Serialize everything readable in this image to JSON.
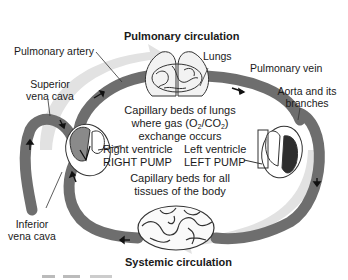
{
  "diagram": {
    "titles": {
      "top": "Pulmonary circulation",
      "bottom": "Systemic circulation"
    },
    "labels": {
      "pulmonary_artery": "Pulmonary artery",
      "lungs": "Lungs",
      "pulmonary_vein": "Pulmonary vein",
      "superior_vena_cava_1": "Superior",
      "superior_vena_cava_2": "vena cava",
      "aorta_1": "Aorta and its",
      "aorta_2": "branches",
      "inferior_vena_cava_1": "Inferior",
      "inferior_vena_cava_2": "vena cava"
    },
    "center": {
      "lung_beds_line1": "Capillary beds of lungs",
      "lung_beds_line2_pre": "where gas (O",
      "lung_beds_sub1": "2",
      "lung_beds_mid": "/CO",
      "lung_beds_sub2": "2",
      "lung_beds_post": ")",
      "lung_beds_line3": "exchange occurs",
      "right_ventricle": "Right ventricle",
      "right_pump": "RIGHT PUMP",
      "left_ventricle": "Left ventricle",
      "left_pump": "LEFT PUMP",
      "tissue_beds_line1": "Capillary beds for all",
      "tissue_beds_line2": "tissues of the body"
    },
    "colors": {
      "vessel": "#6e6e6e",
      "flow_shadow": "#dcdcdc",
      "heart_dark": "#3a3a3a",
      "outline": "#333333"
    }
  }
}
